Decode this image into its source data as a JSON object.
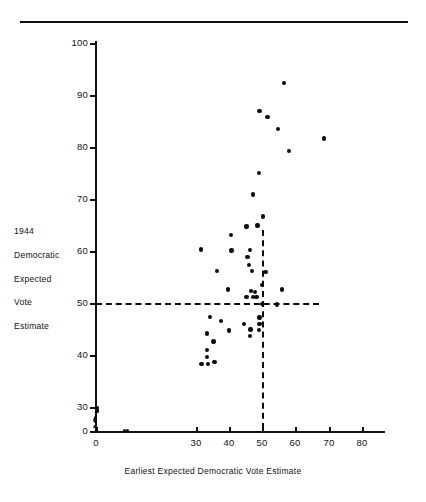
{
  "figure": {
    "has_top_rule": true,
    "background_color": "#ffffff",
    "ink_color": "#111111"
  },
  "chart_data": {
    "type": "scatter",
    "title": "",
    "xlabel": "Earliest Expected Democratic Vote Estimate",
    "ylabel_lines": [
      "1944",
      "Democratic",
      "Expected",
      "Vote",
      "Estimate"
    ],
    "xlim": [
      0,
      84
    ],
    "ylim": [
      0,
      100
    ],
    "xticks": [
      0,
      30,
      40,
      50,
      60,
      70,
      80
    ],
    "yticks": [
      0,
      30,
      40,
      50,
      60,
      70,
      80,
      90,
      100
    ],
    "y_axis_break_between": [
      0,
      30
    ],
    "grid": false,
    "legend": null,
    "reference_lines": [
      {
        "name": "horizontal-50-line",
        "orientation": "horizontal",
        "value": 50,
        "style": "dashed",
        "x_from": 0,
        "x_to": 67
      },
      {
        "name": "vertical-50-line",
        "orientation": "vertical",
        "value": 50,
        "style": "dashed",
        "y_from": 2,
        "y_to": 64
      }
    ],
    "points": [
      {
        "x": 0.5,
        "y": 29.0
      },
      {
        "x": 0.5,
        "y": 27.0
      },
      {
        "x": 0.5,
        "y": 25.5
      },
      {
        "x": 0.5,
        "y": 24.0
      },
      {
        "x": 8.5,
        "y": 0.4
      },
      {
        "x": 9.5,
        "y": 0.4
      },
      {
        "x": 31.5,
        "y": 60.3
      },
      {
        "x": 31.7,
        "y": 38.3
      },
      {
        "x": 33.3,
        "y": 41.0
      },
      {
        "x": 33.4,
        "y": 39.6
      },
      {
        "x": 33.6,
        "y": 38.3
      },
      {
        "x": 33.4,
        "y": 44.1
      },
      {
        "x": 34.3,
        "y": 47.3
      },
      {
        "x": 35.6,
        "y": 38.7
      },
      {
        "x": 35.3,
        "y": 42.6
      },
      {
        "x": 36.3,
        "y": 56.1
      },
      {
        "x": 37.6,
        "y": 46.5
      },
      {
        "x": 39.7,
        "y": 52.6
      },
      {
        "x": 40.0,
        "y": 44.7
      },
      {
        "x": 40.6,
        "y": 63.1
      },
      {
        "x": 40.8,
        "y": 60.1
      },
      {
        "x": 44.6,
        "y": 46.0
      },
      {
        "x": 45.3,
        "y": 64.7
      },
      {
        "x": 45.6,
        "y": 58.9
      },
      {
        "x": 45.3,
        "y": 51.2
      },
      {
        "x": 46.1,
        "y": 57.3
      },
      {
        "x": 46.3,
        "y": 60.2
      },
      {
        "x": 46.6,
        "y": 52.3
      },
      {
        "x": 46.4,
        "y": 43.7
      },
      {
        "x": 46.5,
        "y": 44.9
      },
      {
        "x": 47.0,
        "y": 56.1
      },
      {
        "x": 47.3,
        "y": 51.2
      },
      {
        "x": 47.3,
        "y": 70.9
      },
      {
        "x": 47.9,
        "y": 52.1
      },
      {
        "x": 48.3,
        "y": 51.2
      },
      {
        "x": 48.6,
        "y": 64.9
      },
      {
        "x": 49.1,
        "y": 44.8
      },
      {
        "x": 49.2,
        "y": 46.0
      },
      {
        "x": 49.2,
        "y": 47.2
      },
      {
        "x": 49.0,
        "y": 75.0
      },
      {
        "x": 49.2,
        "y": 86.9
      },
      {
        "x": 50.0,
        "y": 53.5
      },
      {
        "x": 50.0,
        "y": 49.8
      },
      {
        "x": 50.3,
        "y": 66.6
      },
      {
        "x": 51.0,
        "y": 56.0
      },
      {
        "x": 51.6,
        "y": 85.8
      },
      {
        "x": 54.5,
        "y": 49.7
      },
      {
        "x": 54.8,
        "y": 83.5
      },
      {
        "x": 55.9,
        "y": 52.6
      },
      {
        "x": 56.5,
        "y": 92.3
      },
      {
        "x": 58.0,
        "y": 79.2
      },
      {
        "x": 68.5,
        "y": 81.6
      }
    ]
  }
}
